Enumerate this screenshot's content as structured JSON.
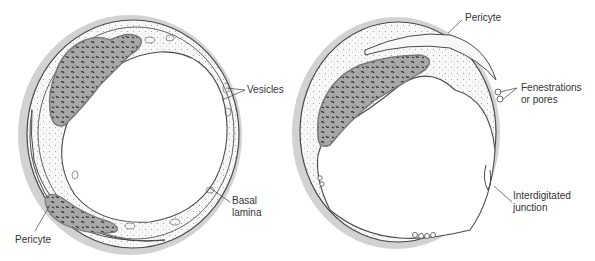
{
  "figure": {
    "left_panel": {
      "name": "continuous-capillary",
      "labels": {
        "vesicles": "Vesicles",
        "basal_lamina_line1": "Basal",
        "basal_lamina_line2": "lamina",
        "pericyte": "Pericyte"
      }
    },
    "right_panel": {
      "name": "fenestrated-capillary",
      "labels": {
        "pericyte": "Pericyte",
        "fenestrations_line1": "Fenestrations",
        "fenestrations_line2": "or pores",
        "junction_line1": "Interdigitated",
        "junction_line2": "junction"
      }
    },
    "colors": {
      "halo": "#cfcfcf",
      "outline": "#4a4a4a",
      "cytoplasm": "#f7f7f7",
      "nucleus": "#a9a9a9",
      "nucleus_rim": "#7a7a7a",
      "chromatin": "#2a2a2a",
      "leader_line": "#555555",
      "text": "#333333"
    }
  }
}
